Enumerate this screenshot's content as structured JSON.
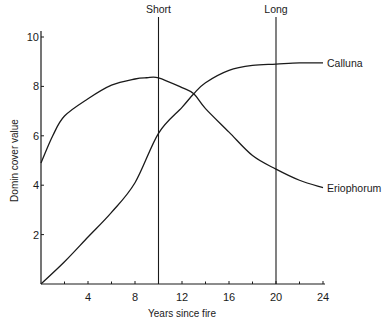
{
  "chart_data": {
    "type": "line",
    "title": "",
    "xlabel": "Years since fire",
    "ylabel": "Domin cover value",
    "xlim": [
      0,
      24
    ],
    "ylim": [
      0,
      10
    ],
    "x_ticks": [
      4,
      8,
      12,
      16,
      20,
      24
    ],
    "x_minor_ticks": [
      2,
      6,
      10,
      14,
      18,
      22
    ],
    "y_ticks": [
      2,
      4,
      6,
      8,
      10
    ],
    "grid": false,
    "legend": "direct labels at right end of curves",
    "vertical_markers": [
      {
        "x": 10,
        "label": "Short"
      },
      {
        "x": 20,
        "label": "Long"
      }
    ],
    "series": [
      {
        "name": "Calluna",
        "x": [
          0,
          2,
          4,
          6,
          8,
          10,
          12,
          13,
          14,
          16,
          18,
          20,
          22,
          24
        ],
        "values": [
          0.0,
          0.9,
          1.9,
          2.9,
          4.1,
          6.1,
          7.15,
          7.7,
          8.15,
          8.65,
          8.85,
          8.9,
          8.95,
          8.95
        ]
      },
      {
        "name": "Eriophorum",
        "x": [
          0,
          1,
          2,
          4,
          6,
          8,
          9,
          10,
          12,
          13,
          14,
          16,
          18,
          20,
          22,
          24
        ],
        "values": [
          4.9,
          6.0,
          6.8,
          7.5,
          8.05,
          8.3,
          8.35,
          8.35,
          7.95,
          7.7,
          7.1,
          6.15,
          5.2,
          4.65,
          4.2,
          3.9
        ]
      }
    ]
  }
}
